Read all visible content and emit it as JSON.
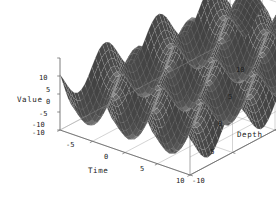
{
  "figure": {
    "background_color": "#ffffff",
    "surface_color": "#3a3a3a",
    "mesh_color": "#d8d8d8",
    "frame_color": "#9a9a9a",
    "text_color": "#1a1a1a"
  },
  "axes": {
    "x": {
      "title": "Time",
      "ticks": [
        "-10",
        "-5",
        "0",
        "5",
        "10"
      ],
      "tick_values": [
        -10,
        -5,
        0,
        5,
        10
      ],
      "range": [
        -10,
        10
      ]
    },
    "y": {
      "title": "Depth",
      "ticks": [
        "-10",
        "-5",
        "0",
        "5",
        "10"
      ],
      "tick_values": [
        -10,
        -5,
        0,
        5,
        10
      ],
      "range": [
        -10,
        10
      ]
    },
    "z": {
      "title": "Value",
      "ticks": [
        "10",
        "5",
        "0",
        "-5",
        "-10"
      ],
      "tick_values": [
        10,
        5,
        0,
        -5,
        -10
      ],
      "range": [
        -10,
        10
      ]
    }
  },
  "chart_data": {
    "type": "surface",
    "title": "",
    "xlabel": "Time",
    "ylabel": "Depth",
    "zlabel": "Value",
    "xlim": [
      -10,
      10
    ],
    "ylim": [
      -10,
      10
    ],
    "zlim": [
      -10,
      10
    ],
    "xticks": [
      -10,
      -5,
      0,
      5,
      10
    ],
    "yticks": [
      -10,
      -5,
      0,
      5,
      10
    ],
    "zticks": [
      -10,
      -5,
      0,
      5,
      10
    ],
    "grid": true,
    "legend": false,
    "function": "z = 5*sin(x) + 5*sin(y)",
    "samples": {
      "x": 48,
      "y": 48
    },
    "projection": {
      "type": "oblique-3d",
      "origin_corner_px": [
        60,
        130
      ],
      "x_axis_end_px": [
        190,
        175
      ],
      "y_axis_end_px": [
        230,
        40
      ],
      "z_height_px": 72
    }
  },
  "tick_labels": {
    "value": [
      {
        "text": "10",
        "x": 39,
        "y": 74
      },
      {
        "text": "5",
        "x": 46,
        "y": 86
      },
      {
        "text": "0",
        "x": 46,
        "y": 98
      },
      {
        "text": "-5",
        "x": 39,
        "y": 110
      },
      {
        "text": "-10",
        "x": 32,
        "y": 121
      }
    ],
    "time": [
      {
        "text": "-10",
        "x": 32,
        "y": 129
      },
      {
        "text": "-5",
        "x": 66,
        "y": 141
      },
      {
        "text": "0",
        "x": 104,
        "y": 153
      },
      {
        "text": "5",
        "x": 140,
        "y": 165
      },
      {
        "text": "10",
        "x": 176,
        "y": 177
      }
    ],
    "depth": [
      {
        "text": "-10",
        "x": 192,
        "y": 177
      },
      {
        "text": "-5",
        "x": 206,
        "y": 148
      },
      {
        "text": "0",
        "x": 218,
        "y": 120
      },
      {
        "text": "5",
        "x": 228,
        "y": 93
      },
      {
        "text": "10",
        "x": 236,
        "y": 66
      }
    ]
  }
}
